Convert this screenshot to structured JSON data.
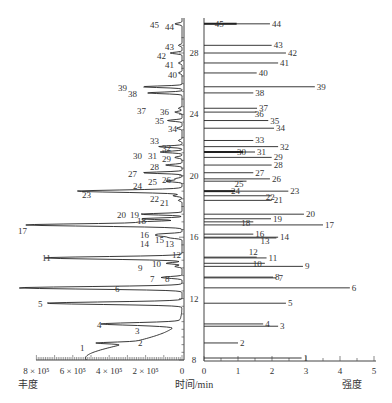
{
  "chart_data": {
    "type": "mirrored-chromatogram",
    "title": "",
    "time_axis": {
      "label": "时间/min",
      "ticks": [
        8,
        12,
        16,
        20,
        24,
        28
      ],
      "range": [
        8,
        30
      ]
    },
    "left_panel": {
      "type": "line",
      "xlabel": "丰度",
      "tick_labels": [
        "8 × 10⁵",
        "6 × 10⁵",
        "4 × 10⁵",
        "2 × 10⁵",
        "0"
      ],
      "ticks": [
        800000,
        600000,
        400000,
        200000,
        0
      ],
      "range": [
        0,
        800000
      ],
      "direction": "leftward"
    },
    "right_panel": {
      "type": "bar",
      "xlabel": "强度",
      "tick_labels": [
        "0",
        "1",
        "2",
        "3",
        "4",
        "5"
      ],
      "ticks": [
        0,
        1,
        2,
        3,
        4,
        5
      ],
      "range": [
        0,
        5
      ],
      "direction": "rightward"
    },
    "peaks": [
      {
        "id": "1",
        "time": 8.13,
        "abundance": 530000,
        "intensity": 2.87
      },
      {
        "id": "2",
        "time": 9.11,
        "abundance": 180000,
        "intensity": 1.0
      },
      {
        "id": "3",
        "time": 10.2,
        "abundance": 40000,
        "intensity": 2.18
      },
      {
        "id": "4",
        "time": 10.35,
        "abundance": 420000,
        "intensity": 1.74
      },
      {
        "id": "5",
        "time": 11.7,
        "abundance": 750000,
        "intensity": 2.41
      },
      {
        "id": "6",
        "time": 12.7,
        "abundance": 900000,
        "intensity": 4.29
      },
      {
        "id": "7",
        "time": 13.35,
        "abundance": 60000,
        "intensity": 2.13
      },
      {
        "id": "8",
        "time": 13.4,
        "abundance": 70000,
        "intensity": 2.03
      },
      {
        "id": "9",
        "time": 14.1,
        "abundance": 40000,
        "intensity": 2.91
      },
      {
        "id": "10",
        "time": 14.3,
        "abundance": 90000,
        "intensity": 1.79
      },
      {
        "id": "11",
        "time": 14.65,
        "abundance": 740000,
        "intensity": 1.84
      },
      {
        "id": "12",
        "time": 14.7,
        "abundance": 30000,
        "intensity": 1.55
      },
      {
        "id": "13",
        "time": 15.95,
        "abundance": 40000,
        "intensity": 2.13
      },
      {
        "id": "14",
        "time": 16.0,
        "abundance": 40000,
        "intensity": 2.18
      },
      {
        "id": "15",
        "time": 16.1,
        "abundance": 120000,
        "intensity": null
      },
      {
        "id": "16",
        "time": 16.2,
        "abundance": 120000,
        "intensity": 1.45
      },
      {
        "id": "17",
        "time": 16.8,
        "abundance": 860000,
        "intensity": 3.5
      },
      {
        "id": "18",
        "time": 17.0,
        "abundance": 190000,
        "intensity": 1.45
      },
      {
        "id": "19",
        "time": 17.2,
        "abundance": 230000,
        "intensity": 1.97
      },
      {
        "id": "20",
        "time": 17.5,
        "abundance": 230000,
        "intensity": 2.94
      },
      {
        "id": "21",
        "time": 18.4,
        "abundance": 20000,
        "intensity": 1.99
      },
      {
        "id": "22",
        "time": 18.7,
        "abundance": 50000,
        "intensity": 1.99
      },
      {
        "id": "23",
        "time": 19.0,
        "abundance": 490000,
        "intensity": 2.48
      },
      {
        "id": "24",
        "time": 19.0,
        "abundance": 90000,
        "intensity": 0.91
      },
      {
        "id": "25",
        "time": 19.65,
        "abundance": 90000,
        "intensity": 1.25
      },
      {
        "id": "26",
        "time": 19.8,
        "abundance": 40000,
        "intensity": 1.94
      },
      {
        "id": "27",
        "time": 20.2,
        "abundance": 220000,
        "intensity": 1.45
      },
      {
        "id": "28",
        "time": 20.7,
        "abundance": 90000,
        "intensity": 1.99
      },
      {
        "id": "29",
        "time": 21.2,
        "abundance": 40000,
        "intensity": 1.99
      },
      {
        "id": "30",
        "time": 21.55,
        "abundance": 60000,
        "intensity": 1.15
      },
      {
        "id": "31",
        "time": 21.55,
        "abundance": 60000,
        "intensity": 1.5
      },
      {
        "id": "32",
        "time": 21.9,
        "abundance": 130000,
        "intensity": 2.18
      },
      {
        "id": "33",
        "time": 22.3,
        "abundance": 20000,
        "intensity": 1.45
      },
      {
        "id": "34",
        "time": 23.1,
        "abundance": 30000,
        "intensity": 2.06
      },
      {
        "id": "35",
        "time": 23.6,
        "abundance": 80000,
        "intensity": 1.89
      },
      {
        "id": "36",
        "time": 24.15,
        "abundance": 40000,
        "intensity": 1.55
      },
      {
        "id": "37",
        "time": 24.4,
        "abundance": 20000,
        "intensity": 1.56
      },
      {
        "id": "38",
        "time": 25.4,
        "abundance": 190000,
        "intensity": 1.45
      },
      {
        "id": "39",
        "time": 25.8,
        "abundance": 220000,
        "intensity": 3.26
      },
      {
        "id": "40",
        "time": 26.7,
        "abundance": 20000,
        "intensity": 1.55
      },
      {
        "id": "41",
        "time": 27.35,
        "abundance": 20000,
        "intensity": 2.18
      },
      {
        "id": "42",
        "time": 28.0,
        "abundance": 65000,
        "intensity": 2.41
      },
      {
        "id": "43",
        "time": 28.5,
        "abundance": 20000,
        "intensity": 1.99
      },
      {
        "id": "44",
        "time": 29.9,
        "abundance": 20000,
        "intensity": 1.94
      },
      {
        "id": "45",
        "time": 29.9,
        "abundance": 20000,
        "intensity": 0.96
      }
    ]
  },
  "labels": {
    "left_xlabel": "丰度",
    "center_label": "时间/min",
    "right_xlabel": "强度"
  }
}
